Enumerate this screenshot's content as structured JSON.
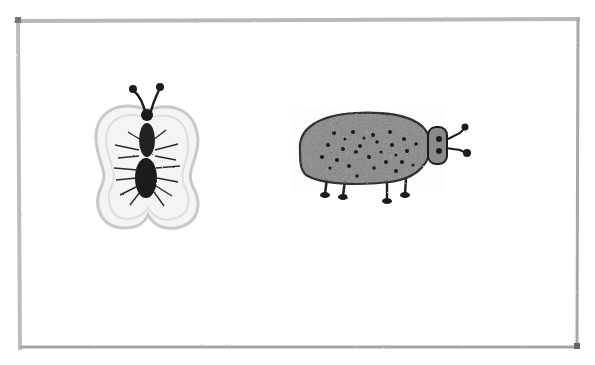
{
  "drawing": {
    "subject": "pencil sketch of two insects inside a rectangular frame",
    "frame": {
      "color": "#9a9a9a"
    },
    "butterfly": {
      "label": "butterfly",
      "wing_color": "#d8d8d8",
      "body_color": "#1a1a1a"
    },
    "beetle": {
      "label": "beetle",
      "body_color": "#8c8c8c",
      "spots_color": "#1a1a1a",
      "spot_count": 28
    }
  },
  "colors": {
    "paper": "#ffffff",
    "pencil_dark": "#1c1c1c",
    "pencil_grey": "#8e8e8e",
    "pencil_light": "#cfcfcf"
  }
}
